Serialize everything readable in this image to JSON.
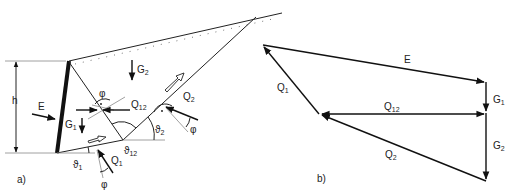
{
  "figure": {
    "panel_a": {
      "label": "a)",
      "height_label": "h",
      "forces": {
        "E": "E",
        "G1": "G",
        "G1_sub": "1",
        "G2": "G",
        "G2_sub": "2",
        "Q1": "Q",
        "Q1_sub": "1",
        "Q2": "Q",
        "Q2_sub": "2",
        "Q12": "Q",
        "Q12_sub": "12"
      },
      "angles": {
        "phi": "φ",
        "theta": "ϑ",
        "theta1_sub": "1",
        "theta2_sub": "2",
        "theta12_sub": "12"
      }
    },
    "panel_b": {
      "label": "b)",
      "forces": {
        "E": "E",
        "G1": "G",
        "G1_sub": "1",
        "G2": "G",
        "G2_sub": "2",
        "Q1": "Q",
        "Q1_sub": "1",
        "Q2": "Q",
        "Q2_sub": "2",
        "Q12": "Q",
        "Q12_sub": "12"
      }
    },
    "colors": {
      "line": "#222222",
      "guide": "#888888",
      "background": "#ffffff"
    }
  }
}
